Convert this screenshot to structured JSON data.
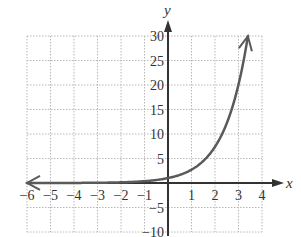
{
  "chart_data": {
    "type": "line",
    "title": "",
    "xlabel": "x",
    "ylabel": "y",
    "xlim": [
      -6,
      4
    ],
    "ylim": [
      -10,
      30
    ],
    "grid": true,
    "x_ticks": [
      -6,
      -5,
      -4,
      -3,
      -2,
      -1,
      1,
      2,
      3,
      4
    ],
    "y_ticks": [
      -10,
      -5,
      5,
      10,
      15,
      20,
      25,
      30
    ],
    "x_tick_labels": [
      "−6",
      "−5",
      "−4",
      "−3",
      "−2",
      "−1",
      "1",
      "2",
      "3",
      "4"
    ],
    "y_tick_labels": [
      "−10",
      "−5",
      "5",
      "10",
      "15",
      "20",
      "25",
      "30"
    ],
    "series": [
      {
        "name": "y = e^x",
        "x": [
          -6,
          -5,
          -4,
          -3,
          -2,
          -1,
          0,
          0.5,
          1,
          1.5,
          2,
          2.5,
          3,
          3.4
        ],
        "y": [
          0.0025,
          0.0067,
          0.018,
          0.05,
          0.135,
          0.368,
          1,
          1.65,
          2.72,
          4.48,
          7.39,
          12.18,
          20.09,
          29.96
        ],
        "arrow_left": true,
        "arrow_right": true
      }
    ],
    "colors": {
      "curve": "#5a5a5a",
      "axis": "#333333",
      "grid": "#b8b8b8"
    }
  },
  "labels": {
    "x_axis": "x",
    "y_axis": "y"
  }
}
